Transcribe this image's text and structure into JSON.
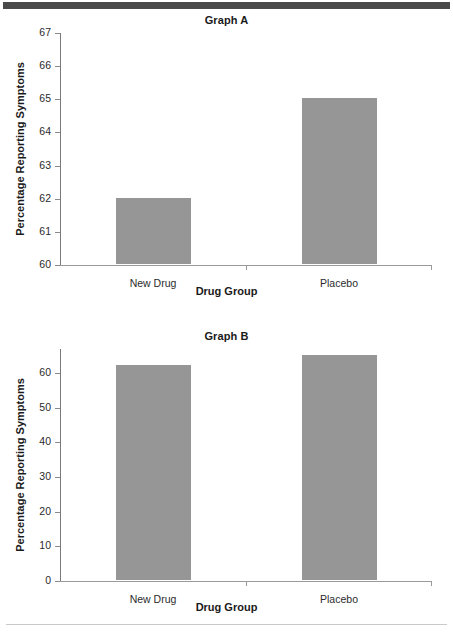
{
  "chart_data": [
    {
      "type": "bar",
      "title": "Graph A",
      "xlabel": "Drug Group",
      "ylabel": "Percentage Reporting Symptoms",
      "categories": [
        "New Drug",
        "Placebo"
      ],
      "values": [
        62,
        65
      ],
      "ylim": [
        60,
        67
      ],
      "yticks": [
        60,
        61,
        62,
        63,
        64,
        65,
        66,
        67
      ],
      "grid": false,
      "legend": false,
      "bar_color": "#969696",
      "axis_color": "#8a8a8a"
    },
    {
      "type": "bar",
      "title": "Graph B",
      "xlabel": "Drug Group",
      "ylabel": "Percentage Reporting Symptoms",
      "categories": [
        "New Drug",
        "Placebo"
      ],
      "values": [
        62,
        65
      ],
      "ylim": [
        0,
        67
      ],
      "yticks": [
        0,
        10,
        20,
        30,
        40,
        50,
        60
      ],
      "grid": false,
      "legend": false,
      "bar_color": "#969696",
      "axis_color": "#8a8a8a"
    }
  ],
  "decor": {
    "top_band_color": "#4a4a4a",
    "bottom_rule_color": "#c9c9c9"
  }
}
